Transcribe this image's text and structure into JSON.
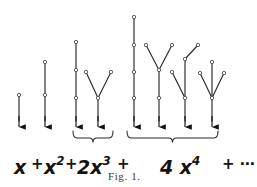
{
  "figure": {
    "caption": "Fig. 1.",
    "background_color": "#ffffff",
    "ink_color": "#2b2824",
    "arrow_color": "#121010",
    "node_fill": "#ffffff",
    "node_stroke": "#4a4540"
  },
  "formula": {
    "terms": [
      {
        "id": "term-x",
        "coefficient": "",
        "base": "x",
        "exponent": "",
        "text": "x",
        "x": 14,
        "y": 158,
        "size": 19
      },
      {
        "id": "term-x2",
        "coefficient": "",
        "base": "x",
        "exponent": "2",
        "text": "x",
        "x": 44,
        "y": 158,
        "size": 19
      },
      {
        "id": "term-2x3",
        "coefficient": "2",
        "base": "x",
        "exponent": "3",
        "text": "2x",
        "x": 77,
        "y": 158,
        "size": 19
      },
      {
        "id": "term-4x4",
        "coefficient": "4",
        "base": "x",
        "exponent": "4",
        "text": "4 x",
        "x": 160,
        "y": 158,
        "size": 19
      }
    ],
    "operators": [
      {
        "id": "plus-1",
        "symbol": "+",
        "x": 31,
        "y": 157,
        "size": 15
      },
      {
        "id": "plus-2",
        "symbol": "+",
        "x": 65,
        "y": 157,
        "size": 15
      },
      {
        "id": "plus-3",
        "symbol": "+",
        "x": 117,
        "y": 157,
        "size": 15
      },
      {
        "id": "plus-dots",
        "symbol": "+ ⋯",
        "x": 222,
        "y": 157,
        "size": 15
      }
    ],
    "braces": [
      {
        "id": "brace-2x3",
        "x1": 73,
        "x2": 113,
        "group": "2x^3"
      },
      {
        "id": "brace-4x4",
        "x1": 127,
        "x2": 218,
        "group": "4x^4"
      }
    ]
  },
  "trees": [
    {
      "id": "tree-1",
      "label": "path-length-1",
      "term": "x",
      "nodes": [
        [
          19,
          95
        ]
      ],
      "edges": [
        [
          19,
          95,
          19,
          121
        ]
      ],
      "arrow": [
        19,
        127
      ]
    },
    {
      "id": "tree-2",
      "label": "path-length-2",
      "term": "x^2",
      "nodes": [
        [
          45,
          62
        ],
        [
          45,
          95
        ]
      ],
      "edges": [
        [
          45,
          62,
          45,
          95
        ],
        [
          45,
          95,
          45,
          121
        ]
      ],
      "arrow": [
        45,
        127
      ]
    },
    {
      "id": "tree-3",
      "label": "path-length-3",
      "term": "2x^3 (a)",
      "nodes": [
        [
          76,
          42
        ],
        [
          76,
          70
        ],
        [
          76,
          98
        ]
      ],
      "edges": [
        [
          76,
          42,
          76,
          70
        ],
        [
          76,
          70,
          76,
          98
        ],
        [
          76,
          98,
          76,
          121
        ]
      ],
      "arrow": [
        76,
        127
      ]
    },
    {
      "id": "tree-4",
      "label": "cherry-y-shape",
      "term": "2x^3 (b)",
      "nodes": [
        [
          86,
          72
        ],
        [
          111,
          72
        ],
        [
          98,
          98
        ]
      ],
      "edges": [
        [
          86,
          72,
          98,
          98
        ],
        [
          111,
          72,
          98,
          98
        ],
        [
          98,
          98,
          98,
          121
        ]
      ],
      "arrow": [
        98,
        127
      ]
    },
    {
      "id": "tree-5",
      "label": "path-length-4",
      "term": "4x^4 (a)",
      "nodes": [
        [
          134,
          17
        ],
        [
          134,
          45
        ],
        [
          134,
          72
        ],
        [
          134,
          98
        ]
      ],
      "edges": [
        [
          134,
          17,
          134,
          45
        ],
        [
          134,
          45,
          134,
          72
        ],
        [
          134,
          72,
          134,
          98
        ],
        [
          134,
          98,
          134,
          121
        ]
      ],
      "arrow": [
        134,
        127
      ]
    },
    {
      "id": "tree-6",
      "label": "y-shape-with-long-stem",
      "term": "4x^4 (b)",
      "nodes": [
        [
          146,
          45
        ],
        [
          172,
          45
        ],
        [
          159,
          70
        ],
        [
          159,
          98
        ]
      ],
      "edges": [
        [
          146,
          45,
          159,
          70
        ],
        [
          172,
          45,
          159,
          70
        ],
        [
          159,
          70,
          159,
          98
        ],
        [
          159,
          98,
          159,
          121
        ]
      ],
      "arrow": [
        159,
        127
      ]
    },
    {
      "id": "tree-7",
      "label": "y-shape-with-extended-branch",
      "term": "4x^4 (c)",
      "nodes": [
        [
          172,
          72
        ],
        [
          198,
          45
        ],
        [
          185,
          59
        ],
        [
          185,
          98
        ]
      ],
      "edges": [
        [
          172,
          72,
          185,
          98
        ],
        [
          198,
          45,
          185,
          59
        ],
        [
          185,
          59,
          185,
          98
        ],
        [
          185,
          98,
          185,
          121
        ]
      ],
      "arrow": [
        185,
        127
      ]
    },
    {
      "id": "tree-8",
      "label": "trident-three-branches",
      "term": "4x^4 (d)",
      "nodes": [
        [
          200,
          73
        ],
        [
          212,
          62
        ],
        [
          224,
          73
        ],
        [
          212,
          98
        ]
      ],
      "edges": [
        [
          200,
          73,
          212,
          98
        ],
        [
          212,
          62,
          212,
          98
        ],
        [
          224,
          73,
          212,
          98
        ],
        [
          212,
          98,
          212,
          121
        ]
      ],
      "arrow": [
        212,
        127
      ]
    }
  ]
}
